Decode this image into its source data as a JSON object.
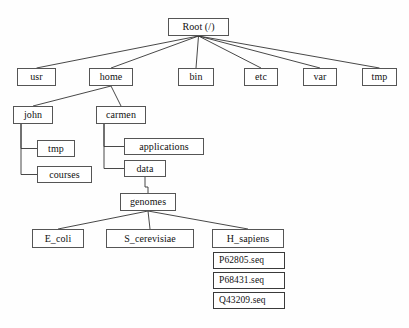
{
  "diagram": {
    "type": "tree",
    "background_color": "#fefefe",
    "box_border_color": "#555555",
    "box_fill_color": "#ffffff",
    "edge_color": "#333333",
    "text_color": "#111111"
  },
  "nodes": [
    {
      "id": "root",
      "label": "Root (/)",
      "kind": "directory",
      "level": 0,
      "x": 168,
      "y": 18,
      "w": 61,
      "h": 18
    },
    {
      "id": "usr",
      "label": "usr",
      "kind": "directory",
      "level": 1,
      "x": 17,
      "y": 68,
      "w": 39,
      "h": 18
    },
    {
      "id": "home",
      "label": "home",
      "kind": "directory",
      "level": 1,
      "x": 89,
      "y": 68,
      "w": 44,
      "h": 18
    },
    {
      "id": "bin",
      "label": "bin",
      "kind": "directory",
      "level": 1,
      "x": 178,
      "y": 68,
      "w": 36,
      "h": 18
    },
    {
      "id": "etc",
      "label": "etc",
      "kind": "directory",
      "level": 1,
      "x": 244,
      "y": 68,
      "w": 34,
      "h": 18
    },
    {
      "id": "var",
      "label": "var",
      "kind": "directory",
      "level": 1,
      "x": 303,
      "y": 68,
      "w": 34,
      "h": 18
    },
    {
      "id": "tmp",
      "label": "tmp",
      "kind": "directory",
      "level": 1,
      "x": 362,
      "y": 68,
      "w": 35,
      "h": 18
    },
    {
      "id": "john",
      "label": "john",
      "kind": "directory",
      "level": 2,
      "x": 13,
      "y": 106,
      "w": 40,
      "h": 18
    },
    {
      "id": "carmen",
      "label": "carmen",
      "kind": "directory",
      "level": 2,
      "x": 96,
      "y": 106,
      "w": 50,
      "h": 18
    },
    {
      "id": "john_tmp",
      "label": "tmp",
      "kind": "directory",
      "level": 3,
      "x": 37,
      "y": 140,
      "w": 38,
      "h": 17
    },
    {
      "id": "john_courses",
      "label": "courses",
      "kind": "directory",
      "level": 3,
      "x": 37,
      "y": 166,
      "w": 55,
      "h": 17
    },
    {
      "id": "applications",
      "label": "applications",
      "kind": "directory",
      "level": 3,
      "x": 124,
      "y": 138,
      "w": 80,
      "h": 17
    },
    {
      "id": "data",
      "label": "data",
      "kind": "directory",
      "level": 3,
      "x": 124,
      "y": 160,
      "w": 42,
      "h": 17
    },
    {
      "id": "genomes",
      "label": "genomes",
      "kind": "directory",
      "level": 4,
      "x": 120,
      "y": 193,
      "w": 56,
      "h": 18
    },
    {
      "id": "e_coli",
      "label": "E_coli",
      "kind": "directory",
      "level": 5,
      "x": 32,
      "y": 229,
      "w": 52,
      "h": 19
    },
    {
      "id": "s_cerevisiae",
      "label": "S_cerevisiae",
      "kind": "directory",
      "level": 5,
      "x": 106,
      "y": 229,
      "w": 88,
      "h": 19
    },
    {
      "id": "h_sapiens",
      "label": "H_sapiens",
      "kind": "directory",
      "level": 5,
      "x": 212,
      "y": 229,
      "w": 72,
      "h": 19
    },
    {
      "id": "p62805",
      "label": "P62805.seq",
      "kind": "file",
      "level": 6,
      "x": 213,
      "y": 252,
      "w": 72,
      "h": 17
    },
    {
      "id": "p68431",
      "label": "P68431.seq",
      "kind": "file",
      "level": 6,
      "x": 213,
      "y": 272,
      "w": 72,
      "h": 17
    },
    {
      "id": "q43209",
      "label": "Q43209.seq",
      "kind": "file",
      "level": 6,
      "x": 213,
      "y": 292,
      "w": 72,
      "h": 17
    }
  ],
  "edges": [
    {
      "from": "root",
      "to": "usr",
      "style": "diagonal"
    },
    {
      "from": "root",
      "to": "home",
      "style": "diagonal"
    },
    {
      "from": "root",
      "to": "bin",
      "style": "diagonal"
    },
    {
      "from": "root",
      "to": "etc",
      "style": "diagonal"
    },
    {
      "from": "root",
      "to": "var",
      "style": "diagonal"
    },
    {
      "from": "root",
      "to": "tmp",
      "style": "diagonal"
    },
    {
      "from": "home",
      "to": "john",
      "style": "diagonal"
    },
    {
      "from": "home",
      "to": "carmen",
      "style": "diagonal"
    },
    {
      "from": "john",
      "to": "john_tmp",
      "style": "elbow"
    },
    {
      "from": "john",
      "to": "john_courses",
      "style": "elbow"
    },
    {
      "from": "carmen",
      "to": "applications",
      "style": "elbow"
    },
    {
      "from": "carmen",
      "to": "data",
      "style": "elbow"
    },
    {
      "from": "data",
      "to": "genomes",
      "style": "elbow-down"
    },
    {
      "from": "genomes",
      "to": "e_coli",
      "style": "diagonal"
    },
    {
      "from": "genomes",
      "to": "s_cerevisiae",
      "style": "diagonal"
    },
    {
      "from": "genomes",
      "to": "h_sapiens",
      "style": "diagonal"
    }
  ]
}
